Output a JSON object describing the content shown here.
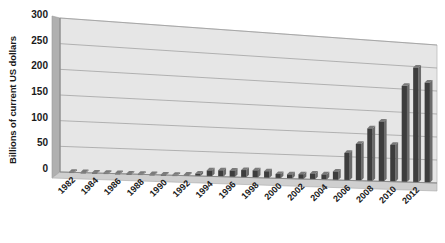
{
  "chart_data": {
    "type": "bar",
    "title": "",
    "subtitle": "",
    "xlabel": "",
    "ylabel": "Billions of current US dollars",
    "ylim": [
      0,
      300
    ],
    "yticks": [
      0,
      50,
      100,
      150,
      200,
      250,
      300
    ],
    "ytick_labels": [
      "0",
      "50",
      "100",
      "150",
      "200",
      "250",
      "300"
    ],
    "grid": true,
    "grid_axis": "y",
    "legend": false,
    "legend_position": "none",
    "style": "3d-perspective-column",
    "bar_color": "#3d3d3d",
    "bar_side_color": "#6b6b6b",
    "plot_floor_color": "#d9d9d9",
    "plot_wall_color": "#e8e8e8",
    "gridline_color": "#9a9a9a",
    "background_color": "#ffffff",
    "categories": [
      "1982",
      "1983",
      "1984",
      "1985",
      "1986",
      "1987",
      "1988",
      "1989",
      "1990",
      "1991",
      "1992",
      "1993",
      "1994",
      "1995",
      "1996",
      "1997",
      "1998",
      "1999",
      "2000",
      "2001",
      "2002",
      "2003",
      "2004",
      "2005",
      "2006",
      "2007",
      "2008",
      "2009",
      "2010",
      "2011",
      "2012",
      "2013"
    ],
    "xtick_labels": [
      "1982",
      "1984",
      "1986",
      "1988",
      "1990",
      "1992",
      "1994",
      "1996",
      "1998",
      "2000",
      "2002",
      "2004",
      "2006",
      "2008",
      "2010",
      "2012"
    ],
    "xtick_interval": 2,
    "xtick_rotation": -45,
    "values": [
      1,
      1,
      1,
      1,
      1,
      1,
      1,
      1,
      1,
      1,
      2,
      5,
      12,
      13,
      13,
      15,
      15,
      14,
      9,
      9,
      10,
      12,
      11,
      18,
      58,
      78,
      112,
      128,
      79,
      207,
      248,
      217
    ],
    "units": "billions of current US dollars"
  }
}
